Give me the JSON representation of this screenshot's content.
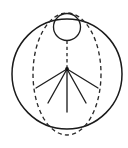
{
  "figure": {
    "kind": "line-diagram",
    "background_color": "#ffffff",
    "stroke_color": "#1a1a1a",
    "dash_color": "#2a2a2a",
    "canvas": {
      "width": 128,
      "height": 148
    },
    "labels": {
      "outer_sphere": "outer sphere outline",
      "meridian": "dashed meridian ellipse",
      "pole_circle": "small circle at top pole",
      "axis": "dashed vertical axis",
      "apex": "ray origin point",
      "rays": "radiating ray bundle"
    },
    "shapes": {
      "outer_circle": {
        "cx": 67,
        "cy": 74,
        "r": 55
      },
      "meridian_ellipse": {
        "cx": 67,
        "cy": 74,
        "rx": 34,
        "ry": 61
      },
      "pole_circle": {
        "cx": 67,
        "cy": 27,
        "r": 13.5
      },
      "axis_line": {
        "x1": 67,
        "y1": 40.5,
        "x2": 67,
        "y2": 69
      },
      "apex_point": {
        "x": 67,
        "y": 69,
        "r": 1.9
      },
      "rays": [
        {
          "name": "ray-far-left",
          "x1": 67,
          "y1": 69,
          "x2": 36,
          "y2": 88
        },
        {
          "name": "ray-left",
          "x1": 67,
          "y1": 69,
          "x2": 48,
          "y2": 103
        },
        {
          "name": "ray-center",
          "x1": 67,
          "y1": 69,
          "x2": 67,
          "y2": 112
        },
        {
          "name": "ray-right",
          "x1": 67,
          "y1": 69,
          "x2": 86,
          "y2": 103
        },
        {
          "name": "ray-far-right",
          "x1": 67,
          "y1": 69,
          "x2": 98,
          "y2": 88
        }
      ]
    }
  },
  "chart_data": {
    "type": "scatter",
    "xlabel": "",
    "ylabel": "",
    "xlim": [
      0,
      128
    ],
    "ylim": [
      0,
      148
    ],
    "grid": false,
    "legend": "none",
    "annotations": [
      "outer sphere circle, center (67, 74), radius 55",
      "dashed meridian ellipse, center (67, 74), semi-axes 34 x 61",
      "small circle at top pole, center (67, 27), radius 13.5",
      "dashed vertical axis from (67, 40.5) to (67, 69)",
      "five straight rays radiating downward from apex (67, 69)"
    ],
    "series": [
      {
        "name": "ray endpoints",
        "x": [
          36,
          48,
          67,
          86,
          98
        ],
        "y": [
          88,
          103,
          112,
          103,
          88
        ]
      }
    ]
  }
}
